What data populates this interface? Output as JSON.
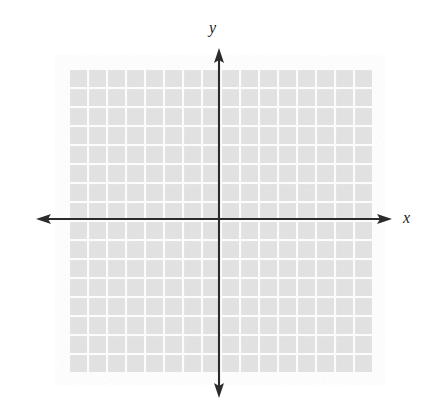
{
  "figure": {
    "kind": "blank-cartesian-coordinate-plane",
    "width": 427,
    "height": 418,
    "background_color": "#ffffff"
  },
  "labels": {
    "x_axis": "x",
    "y_axis": "y"
  },
  "chart_data": {
    "type": "scatter",
    "title": "",
    "subtitle": "",
    "xlabel": "x",
    "ylabel": "y",
    "series": [
      {
        "name": "",
        "x": [],
        "y": []
      }
    ],
    "annotations": [],
    "legend": {
      "entries": [],
      "position": "none",
      "visible": false
    },
    "grid": {
      "visible": true,
      "columns": 16,
      "rows": 16,
      "cell_size_px": 19,
      "cell_fill_color": "#e4e4e4",
      "gridline_color": "#ffffff",
      "gridline_width_px": 2,
      "left_px": 68,
      "top_px": 68,
      "right_px": 372,
      "bottom_px": 372
    },
    "axes": {
      "color": "#2b2b2b",
      "line_width_px": 2,
      "arrowheads": [
        "left",
        "right",
        "up",
        "down"
      ],
      "origin_px": {
        "x": 219,
        "y": 219
      },
      "x_axis_px": {
        "from": 36,
        "to": 392,
        "y": 219
      },
      "y_axis_px": {
        "from": 48,
        "to": 398,
        "x": 219
      },
      "xlim": [
        -8,
        8
      ],
      "ylim": [
        -8,
        8
      ],
      "x_tick_labels": [],
      "y_tick_labels": [],
      "tick_interval": 1
    }
  }
}
